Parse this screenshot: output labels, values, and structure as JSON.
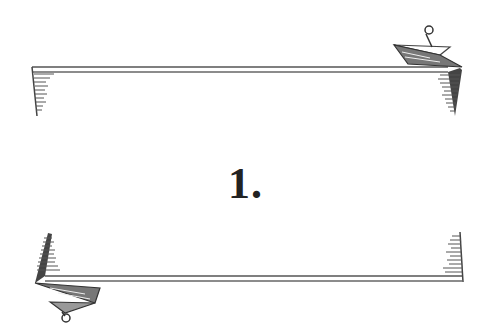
{
  "illustration": {
    "label": "1.",
    "ink_color": "#3a3a3a",
    "banners": [
      {
        "position": "top",
        "tab_side": "right"
      },
      {
        "position": "bottom",
        "tab_side": "left"
      }
    ]
  }
}
